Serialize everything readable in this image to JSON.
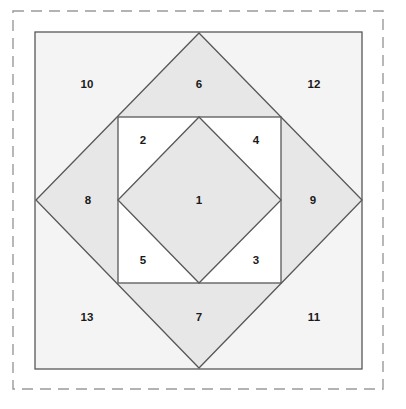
{
  "figure": {
    "canvas": {
      "width": 406,
      "height": 409
    },
    "colors": {
      "page_background": "#ffffff",
      "outer_square_fill": "#f4f4f4",
      "diamond_fill": "#e7e7e7",
      "inner_square_fill": "#ffffff",
      "inner_diamond_fill": "#e7e7e7",
      "stroke": "#585858",
      "dashed_border": "#9a9a9a",
      "label_color": "#1a1a1a"
    },
    "border": {
      "style": "dashed",
      "x": 13,
      "y": 11,
      "width": 370,
      "height": 378
    },
    "shapes": [
      {
        "name": "outer-square",
        "type": "rect",
        "x": 35,
        "y": 32,
        "width": 327,
        "height": 337,
        "shaded": false
      },
      {
        "name": "large-diamond",
        "type": "polygon",
        "points": "199,33 362,200 199,368 36,200",
        "shaded": true
      },
      {
        "name": "inner-square",
        "type": "rect",
        "x": 118,
        "y": 117,
        "width": 163,
        "height": 166,
        "shaded": false
      },
      {
        "name": "inner-diamond",
        "type": "polygon",
        "points": "199,117 281,200 199,283 118,200",
        "shaded": true
      }
    ],
    "labels": [
      {
        "id": "region-1",
        "text": "1",
        "x": 199,
        "y": 201,
        "region": "inner-diamond-center"
      },
      {
        "id": "region-2",
        "text": "2",
        "x": 143,
        "y": 141,
        "region": "inner-square-top-left-triangle"
      },
      {
        "id": "region-3",
        "text": "3",
        "x": 256,
        "y": 261,
        "region": "inner-square-bottom-right-triangle"
      },
      {
        "id": "region-4",
        "text": "4",
        "x": 256,
        "y": 141,
        "region": "inner-square-top-right-triangle"
      },
      {
        "id": "region-5",
        "text": "5",
        "x": 143,
        "y": 261,
        "region": "inner-square-bottom-left-triangle"
      },
      {
        "id": "region-6",
        "text": "6",
        "x": 199,
        "y": 85,
        "region": "diamond-top-triangle"
      },
      {
        "id": "region-7",
        "text": "7",
        "x": 199,
        "y": 318,
        "region": "diamond-bottom-triangle"
      },
      {
        "id": "region-8",
        "text": "8",
        "x": 88,
        "y": 201,
        "region": "diamond-left-triangle"
      },
      {
        "id": "region-9",
        "text": "9",
        "x": 313,
        "y": 201,
        "region": "diamond-right-triangle"
      },
      {
        "id": "region-10",
        "text": "10",
        "x": 87,
        "y": 85,
        "region": "outer-corner-top-left"
      },
      {
        "id": "region-11",
        "text": "11",
        "x": 314,
        "y": 318,
        "region": "outer-corner-bottom-right"
      },
      {
        "id": "region-12",
        "text": "12",
        "x": 314,
        "y": 85,
        "region": "outer-corner-top-right"
      },
      {
        "id": "region-13",
        "text": "13",
        "x": 87,
        "y": 318,
        "region": "outer-corner-bottom-left"
      }
    ]
  }
}
